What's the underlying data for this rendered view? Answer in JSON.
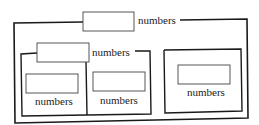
{
  "diagram": {
    "outer_group": {
      "label": "numbers",
      "children": [
        {
          "kind": "group",
          "label": "numbers",
          "children": [
            {
              "kind": "field",
              "label": "numbers"
            },
            {
              "kind": "field",
              "label": "numbers"
            }
          ]
        },
        {
          "kind": "panel",
          "children": [
            {
              "kind": "field",
              "label": "numbers"
            }
          ]
        }
      ]
    }
  },
  "colors": {
    "line": "#1a1a1a",
    "box_border": "#444444",
    "background": "#ffffff"
  }
}
